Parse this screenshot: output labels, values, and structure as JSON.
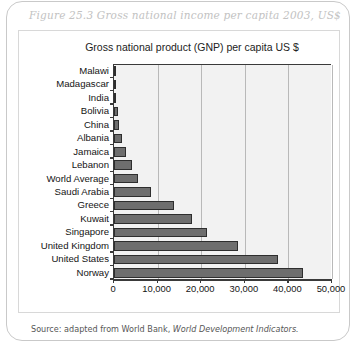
{
  "figure": {
    "title": "Figure 25.3  Gross national income per capita 2003, US$",
    "source_prefix": "Source:  adapted from World Bank,",
    "source_italic": "World Development Indicators."
  },
  "chart_data": {
    "type": "bar",
    "orientation": "horizontal",
    "title": "Gross national  product (GNP) per capita US $",
    "xlabel": "",
    "ylabel": "",
    "xlim": [
      0,
      50000
    ],
    "xticks": [
      0,
      10000,
      20000,
      30000,
      40000,
      50000
    ],
    "xtick_labels": [
      "0",
      "10,000",
      "20,000",
      "30,000",
      "40,000",
      "50,000"
    ],
    "grid": true,
    "legend": false,
    "bar_color": "#6e6e6e",
    "bar_edge_color": "#2e2e2e",
    "plot_background": "#f2f2f2",
    "categories": [
      "Malawi",
      "Madagascar",
      "India",
      "Bolivia",
      "China",
      "Albania",
      "Jamaica",
      "Lebanon",
      "World Average",
      "Saudi Arabia",
      "Greece",
      "Kuwait",
      "Singapore",
      "United Kingdom",
      "United States",
      "Norway"
    ],
    "values": [
      170,
      290,
      530,
      890,
      1100,
      1740,
      2760,
      4040,
      5500,
      8530,
      13720,
      17960,
      21230,
      28350,
      37610,
      43350
    ]
  }
}
